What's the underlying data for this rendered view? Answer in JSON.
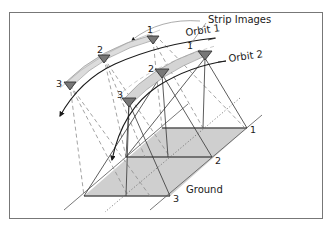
{
  "figure": {
    "type": "satellite stereo strip imaging geometry diagram",
    "labels": {
      "strip_images": "Strip Images",
      "orbit1": "Orbit 1",
      "orbit2": "Orbit 2",
      "ground": "Ground"
    },
    "orbit1_positions": [
      "1",
      "2",
      "3"
    ],
    "orbit2_positions": [
      "1",
      "2",
      "3"
    ],
    "ground_positions": [
      "1",
      "2",
      "3"
    ],
    "colors": {
      "line": "#1a1a1a",
      "strip_fill": "#d9d9d9",
      "ground_fill": "#cfcfcf",
      "dashed": "#8c8c8c",
      "frame": "#777777"
    }
  }
}
